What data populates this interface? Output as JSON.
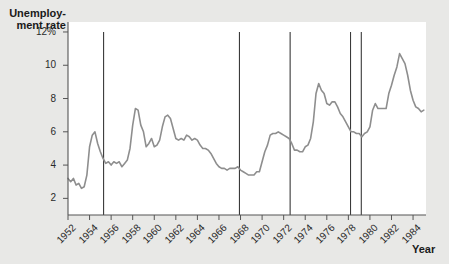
{
  "chart_data": {
    "type": "line",
    "title": "",
    "ylabel": "Unemploy-\nment rate",
    "xlabel": "Year",
    "ylim": [
      1.0,
      12.6
    ],
    "xlim": [
      1952.0,
      1985.2
    ],
    "grid": false,
    "legend": "none",
    "y_ticks": [
      {
        "value": 12,
        "label": "12%"
      },
      {
        "value": 10,
        "label": "10"
      },
      {
        "value": 8,
        "label": "8"
      },
      {
        "value": 6,
        "label": "6"
      },
      {
        "value": 4,
        "label": "4"
      },
      {
        "value": 2,
        "label": "2"
      }
    ],
    "x_ticks": [
      {
        "value": 1952,
        "label": "1952"
      },
      {
        "value": 1954,
        "label": "1954"
      },
      {
        "value": 1956,
        "label": "1956"
      },
      {
        "value": 1958,
        "label": "1958"
      },
      {
        "value": 1960,
        "label": "1960"
      },
      {
        "value": 1962,
        "label": "1962"
      },
      {
        "value": 1964,
        "label": "1964"
      },
      {
        "value": 1966,
        "label": "1966"
      },
      {
        "value": 1968,
        "label": "1968"
      },
      {
        "value": 1970,
        "label": "1970"
      },
      {
        "value": 1972,
        "label": "1972"
      },
      {
        "value": 1974,
        "label": "1974"
      },
      {
        "value": 1976,
        "label": "1976"
      },
      {
        "value": 1978,
        "label": "1978"
      },
      {
        "value": 1980,
        "label": "1980"
      },
      {
        "value": 1982,
        "label": "1982"
      },
      {
        "value": 1984,
        "label": "1984"
      }
    ],
    "series": [
      {
        "name": "Unemployment rate",
        "color": "#8e8e8e",
        "x": [
          1952.0,
          1952.25,
          1952.5,
          1952.75,
          1953.0,
          1953.25,
          1953.5,
          1953.75,
          1954.0,
          1954.25,
          1954.5,
          1954.75,
          1955.0,
          1955.25,
          1955.5,
          1955.75,
          1956.0,
          1956.25,
          1956.5,
          1956.75,
          1957.0,
          1957.25,
          1957.5,
          1957.75,
          1958.0,
          1958.25,
          1958.5,
          1958.75,
          1959.0,
          1959.25,
          1959.5,
          1959.75,
          1960.0,
          1960.25,
          1960.5,
          1960.75,
          1961.0,
          1961.25,
          1961.5,
          1961.75,
          1962.0,
          1962.25,
          1962.5,
          1962.75,
          1963.0,
          1963.25,
          1963.5,
          1963.75,
          1964.0,
          1964.25,
          1964.5,
          1964.75,
          1965.0,
          1965.25,
          1965.5,
          1965.75,
          1966.0,
          1966.25,
          1966.5,
          1966.75,
          1967.0,
          1967.25,
          1967.5,
          1967.75,
          1968.0,
          1968.25,
          1968.5,
          1968.75,
          1969.0,
          1969.25,
          1969.5,
          1969.75,
          1970.0,
          1970.25,
          1970.5,
          1970.75,
          1971.0,
          1971.25,
          1971.5,
          1971.75,
          1972.0,
          1972.25,
          1972.5,
          1972.75,
          1973.0,
          1973.25,
          1973.5,
          1973.75,
          1974.0,
          1974.25,
          1974.5,
          1974.75,
          1975.0,
          1975.25,
          1975.5,
          1975.75,
          1976.0,
          1976.25,
          1976.5,
          1976.75,
          1977.0,
          1977.25,
          1977.5,
          1977.75,
          1978.0,
          1978.25,
          1978.5,
          1978.75,
          1979.0,
          1979.25,
          1979.5,
          1979.75,
          1980.0,
          1980.25,
          1980.5,
          1980.75,
          1981.0,
          1981.25,
          1981.5,
          1981.75,
          1982.0,
          1982.25,
          1982.5,
          1982.75,
          1983.0,
          1983.25,
          1983.5,
          1983.75,
          1984.0,
          1984.25,
          1984.5,
          1984.75,
          1985.0
        ],
        "values": [
          3.2,
          3.0,
          3.2,
          2.8,
          2.9,
          2.6,
          2.7,
          3.4,
          5.1,
          5.8,
          6.0,
          5.3,
          4.8,
          4.4,
          4.1,
          4.2,
          4.0,
          4.2,
          4.1,
          4.2,
          3.9,
          4.1,
          4.3,
          5.0,
          6.4,
          7.4,
          7.3,
          6.4,
          6.0,
          5.1,
          5.3,
          5.6,
          5.1,
          5.2,
          5.5,
          6.3,
          6.9,
          7.0,
          6.8,
          6.2,
          5.6,
          5.5,
          5.6,
          5.5,
          5.8,
          5.7,
          5.5,
          5.6,
          5.5,
          5.2,
          5.0,
          5.0,
          4.9,
          4.7,
          4.4,
          4.1,
          3.9,
          3.8,
          3.8,
          3.7,
          3.8,
          3.8,
          3.8,
          3.9,
          3.7,
          3.6,
          3.5,
          3.4,
          3.4,
          3.4,
          3.6,
          3.6,
          4.2,
          4.8,
          5.2,
          5.8,
          5.9,
          5.9,
          6.0,
          5.9,
          5.8,
          5.7,
          5.6,
          5.3,
          4.9,
          4.9,
          4.8,
          4.8,
          5.1,
          5.2,
          5.6,
          6.6,
          8.3,
          8.9,
          8.5,
          8.3,
          7.7,
          7.6,
          7.8,
          7.8,
          7.5,
          7.1,
          6.9,
          6.6,
          6.3,
          6.0,
          6.0,
          5.9,
          5.9,
          5.7,
          5.9,
          6.0,
          6.3,
          7.3,
          7.7,
          7.4,
          7.4,
          7.4,
          7.4,
          8.3,
          8.8,
          9.4,
          9.9,
          10.7,
          10.4,
          10.1,
          9.4,
          8.5,
          7.9,
          7.5,
          7.4,
          7.2,
          7.3
        ]
      }
    ],
    "vertical_markers": {
      "label": "recession-markers",
      "color": "#3a3a3a",
      "x_values": [
        1955.3,
        1967.9,
        1972.6,
        1978.2,
        1979.2
      ]
    }
  }
}
